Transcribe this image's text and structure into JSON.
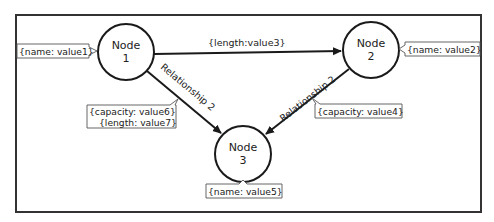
{
  "diagram": {
    "type": "property-graph",
    "frame": {
      "x": 16,
      "y": 15,
      "width": 465,
      "height": 197
    },
    "nodes": [
      {
        "id": "node1",
        "line1": "Node",
        "line2": "1",
        "cx": 126,
        "cy": 52,
        "r": 28
      },
      {
        "id": "node2",
        "line1": "Node",
        "line2": "2",
        "cx": 371,
        "cy": 50,
        "r": 28
      },
      {
        "id": "node3",
        "line1": "Node",
        "line2": "3",
        "cx": 243,
        "cy": 154,
        "r": 28
      }
    ],
    "edges": [
      {
        "id": "edge-1-2",
        "from": "node1",
        "to": "node2",
        "label": "{length:value3}"
      },
      {
        "id": "edge-1-3",
        "from": "node1",
        "to": "node3",
        "label": "Relationship 2"
      },
      {
        "id": "edge-2-3",
        "from": "node2",
        "to": "node3",
        "label": "Relationship 2"
      }
    ],
    "properties": [
      {
        "id": "prop-node1",
        "attached_to": "node1",
        "lines": [
          "{name: value1}"
        ]
      },
      {
        "id": "prop-node2",
        "attached_to": "node2",
        "lines": [
          "{name: value2}"
        ]
      },
      {
        "id": "prop-node3",
        "attached_to": "node3",
        "lines": [
          "{name: value5}"
        ]
      },
      {
        "id": "prop-edge-1-3",
        "attached_to": "edge-1-3",
        "lines": [
          "{capacity: value6}",
          "{length: value7}"
        ]
      },
      {
        "id": "prop-edge-2-3",
        "attached_to": "edge-2-3",
        "lines": [
          "{capacity: value4}"
        ]
      }
    ]
  }
}
